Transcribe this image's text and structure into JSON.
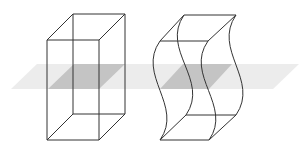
{
  "figure": {
    "colors": {
      "background": "#ffffff",
      "plane": "#ececec",
      "cross_section": "#c4c4c4",
      "edges": "#333333"
    },
    "plane": {
      "points": "11,89 37,64 299,64 273,89"
    },
    "left_solid": {
      "name": "rectangular-prism",
      "cross_section": "48,89 74,64 125,64 99,89",
      "edges": [
        "M47,40 L99,40 L99,140 L47,140 Z",
        "M73,14 L125,14 L125,114 L73,114 Z",
        "M47,40 L73,14",
        "M99,40 L125,14",
        "M99,140 L125,114",
        "M47,140 L73,114"
      ]
    },
    "right_solid": {
      "name": "wavy-prism",
      "cross_section": "160,89 183,64 232,64 209,89",
      "edges": [
        "M160,41 L208,41",
        "M184,15 L236,15",
        "M160,41 L184,15",
        "M208,41 L236,15",
        "M160,140 L209,140",
        "M186,115 L236,115",
        "M160,140 L186,115",
        "M209,140 L236,115",
        "M160,41 C136,75 184,106 160,140",
        "M208,41 C184,75 233,106 209,140",
        "M184,15 C160,50 210,80 186,115",
        "M236,15 C212,50 260,80 236,115"
      ]
    }
  }
}
